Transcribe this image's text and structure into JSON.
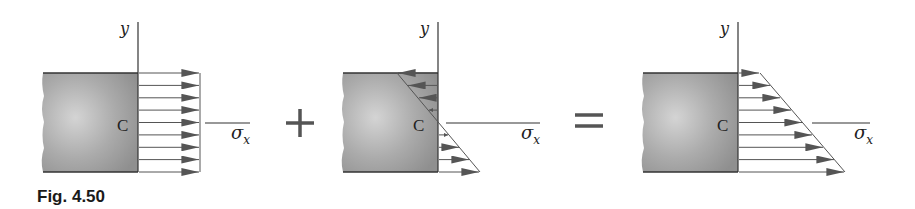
{
  "figure": {
    "caption": "Fig. 4.50",
    "operators": {
      "plus": "+",
      "equals": "="
    },
    "panels": [
      {
        "name": "uniform-stress",
        "axis_y_label": "y",
        "axis_x_label": "σ",
        "axis_x_subscript": "x",
        "centroid_label": "C",
        "distribution": "uniform tension",
        "arrow_count": 9
      },
      {
        "name": "bending-stress",
        "axis_y_label": "y",
        "axis_x_label": "σ",
        "axis_x_subscript": "x",
        "centroid_label": "C",
        "distribution": "linear (compression top, tension bottom)",
        "arrow_count": 8
      },
      {
        "name": "combined-stress",
        "axis_y_label": "y",
        "axis_x_label": "σ",
        "axis_x_subscript": "x",
        "centroid_label": "C",
        "distribution": "trapezoidal tension",
        "arrow_count": 9
      }
    ],
    "colors": {
      "block_fill": "#a8a8a8",
      "block_highlight": "#d0d0d0",
      "line": "#333333",
      "arrow": "#555555",
      "operator": "#555555"
    }
  }
}
